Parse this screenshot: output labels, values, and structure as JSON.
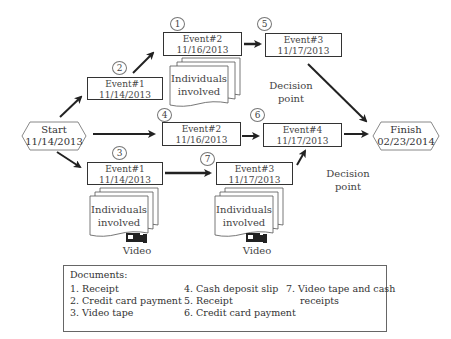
{
  "diagram": {
    "start": {
      "label": "Start",
      "date": "11/14/2013"
    },
    "finish": {
      "label": "Finish",
      "date": "02/23/2014"
    },
    "events": [
      {
        "id": "top-event1",
        "marker": "2",
        "name": "Event#1",
        "date": "11/14/2013"
      },
      {
        "id": "top-event2",
        "marker": "1",
        "name": "Event#2",
        "date": "11/16/2013"
      },
      {
        "id": "top-event3",
        "marker": "5",
        "name": "Event#3",
        "date": "11/17/2013"
      },
      {
        "id": "mid-event2",
        "marker": "4",
        "name": "Event#2",
        "date": "11/16/2013"
      },
      {
        "id": "mid-event4",
        "marker": "6",
        "name": "Event#4",
        "date": "11/17/2013"
      },
      {
        "id": "bot-event1",
        "marker": "3",
        "name": "Event#1",
        "date": "11/14/2013"
      },
      {
        "id": "bot-event3",
        "marker": "7",
        "name": "Event#3",
        "date": "11/17/2013"
      }
    ],
    "individuals": {
      "line1": "Individuals",
      "line2": "involved"
    },
    "decision_points": [
      {
        "line1": "Decision",
        "line2": "point"
      },
      {
        "line1": "Decision",
        "line2": "point"
      }
    ],
    "video_label": "Video",
    "icons": {
      "video": "video-camera-icon",
      "arrow": "arrow-icon",
      "documents": "document-stack-icon"
    }
  },
  "documents": {
    "title": "Documents:",
    "columns": [
      [
        "1. Receipt",
        "2. Credit card payment",
        "3. Video tape"
      ],
      [
        "4. Cash deposit slip",
        "5. Receipt",
        "6. Credit card payment"
      ],
      [
        "7. Video tape and cash",
        "receipts"
      ]
    ]
  },
  "colors": {
    "stroke": "#333333",
    "text": "#444444",
    "background": "#ffffff"
  }
}
